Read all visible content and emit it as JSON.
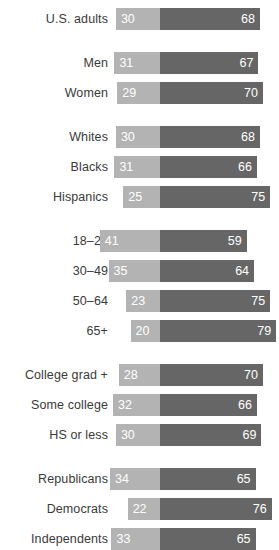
{
  "chart_data": {
    "type": "bar",
    "title": "",
    "subtitle": "",
    "xlabel": "",
    "ylabel": "",
    "orientation": "horizontal",
    "stacked": true,
    "grid": false,
    "legend": null,
    "axis_anchor_value": 0,
    "series": [
      {
        "name": "left-segment",
        "color": "#b3b3b3"
      },
      {
        "name": "right-segment",
        "color": "#666666"
      }
    ],
    "groups": [
      {
        "name": "total",
        "rows": [
          {
            "label": "U.S. adults",
            "left": 30,
            "right": 68
          }
        ]
      },
      {
        "name": "gender",
        "rows": [
          {
            "label": "Men",
            "left": 31,
            "right": 67
          },
          {
            "label": "Women",
            "left": 29,
            "right": 70
          }
        ]
      },
      {
        "name": "race",
        "rows": [
          {
            "label": "Whites",
            "left": 30,
            "right": 68
          },
          {
            "label": "Blacks",
            "left": 31,
            "right": 66
          },
          {
            "label": "Hispanics",
            "left": 25,
            "right": 75
          }
        ]
      },
      {
        "name": "age",
        "rows": [
          {
            "label": "18–29",
            "left": 41,
            "right": 59
          },
          {
            "label": "30–49",
            "left": 35,
            "right": 64
          },
          {
            "label": "50–64",
            "left": 23,
            "right": 75
          },
          {
            "label": "65+",
            "left": 20,
            "right": 79
          }
        ]
      },
      {
        "name": "education",
        "rows": [
          {
            "label": "College grad +",
            "left": 28,
            "right": 70
          },
          {
            "label": "Some college",
            "left": 32,
            "right": 66
          },
          {
            "label": "HS or less",
            "left": 30,
            "right": 69
          }
        ]
      },
      {
        "name": "party",
        "rows": [
          {
            "label": "Republicans",
            "left": 34,
            "right": 65
          },
          {
            "label": "Democrats",
            "left": 22,
            "right": 76
          },
          {
            "label": "Independents",
            "left": 33,
            "right": 65
          }
        ]
      }
    ]
  },
  "layout": {
    "label_column_width": 108,
    "divider_x": 160,
    "px_per_unit": 1.47,
    "bar_height": 22,
    "row_gap": 8,
    "group_gap": 14,
    "top_offset": 8
  },
  "colors": {
    "left_segment": "#b3b3b3",
    "right_segment": "#666666",
    "value_text": "#ffffff",
    "label_text": "#3a3a3a",
    "background": "#ffffff"
  }
}
